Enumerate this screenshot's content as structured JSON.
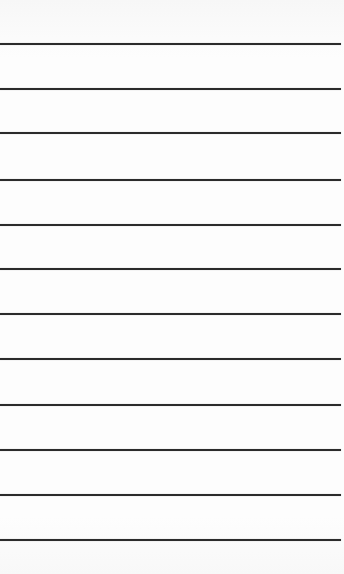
{
  "image": {
    "description": "Ruled lined paper with horizontal lines",
    "background_color": "#fbfbfb",
    "line_color": "#2b2b2b",
    "line_count": 12,
    "line_positions_y": [
      44,
      89,
      133,
      180,
      225,
      269,
      314,
      359,
      405,
      450,
      495,
      540
    ]
  }
}
